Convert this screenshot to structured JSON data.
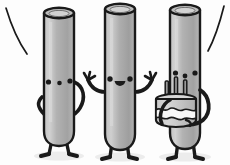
{
  "scene": {
    "title": "Three cylinder characters celebrating with a birthday cake",
    "width": 230,
    "height": 165,
    "background_color": "#fdfdfd",
    "style": "flat cartoon illustration, grayscale",
    "caption": ""
  },
  "palette": {
    "outline": "#1a1a1a",
    "body_light": "#c9c9c9",
    "body_mid": "#ababab",
    "body_shade": "#949494",
    "body_highlight": "#d8d8d8",
    "cap_top_fill": "#bdbdbd",
    "cap_top_inner": "#cfcfcf",
    "cake_top": "#d2d2d2",
    "cake_frosting": "#f7f7f7",
    "cake_base": "#b3b3b3",
    "candle": "#9a9a9a",
    "shadow": "#e9e9e9",
    "background": "#fdfdfd"
  },
  "decorations": {
    "arc_left": {
      "label": "motion-arc-left",
      "description": "thin curved line arcing down in the upper-left corner"
    },
    "arc_right": {
      "label": "motion-arc-right",
      "description": "thin curved line arcing down in the upper-right corner"
    }
  },
  "characters": [
    {
      "id": "character-left",
      "name": "Left cylinder character",
      "pose": "waving",
      "height_rank": "short",
      "face": {
        "expression": "neutral",
        "left_eye": "dot",
        "right_eye": "dot",
        "mouth": "small dot",
        "mouth_shape": "dot"
      },
      "arms": {
        "left": "wavy arm hanging down along the body",
        "right": "curved arm bent outward to the side"
      },
      "legs": 2,
      "holding": ""
    },
    {
      "id": "character-middle",
      "name": "Middle cylinder character",
      "pose": "cheering with both arms raised",
      "height_rank": "tall",
      "face": {
        "expression": "open mouth happy",
        "left_eye": "dot",
        "right_eye": "dot",
        "mouth": "open rounded mouth",
        "mouth_shape": "open"
      },
      "arms": {
        "left": "raised arm with splayed fingers",
        "right": "raised arm with splayed fingers"
      },
      "legs": 2,
      "holding": ""
    },
    {
      "id": "character-right",
      "name": "Right cylinder character",
      "pose": "holding a birthday cake",
      "height_rank": "tall",
      "face": {
        "expression": "neutral",
        "left_eye": "dot",
        "right_eye": "dot",
        "mouth": "small dot",
        "mouth_shape": "dot"
      },
      "arms": {
        "left": "arm reaching down under the cake",
        "right": "curved arm wrapping around to support the cake"
      },
      "legs": 2,
      "holding": "birthday-cake"
    }
  ],
  "cake": {
    "id": "birthday-cake",
    "name": "Birthday cake",
    "candle_count": 3,
    "candles_lit": false,
    "layers": [
      "top",
      "frosting drip",
      "base"
    ],
    "description": "round cake with wavy frosting drip and three candles on top"
  }
}
